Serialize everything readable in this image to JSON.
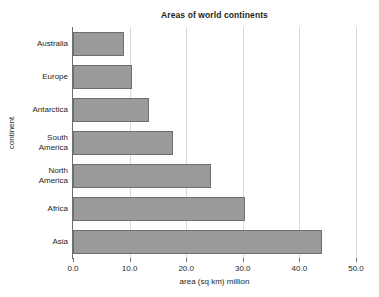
{
  "chart_data": {
    "type": "bar",
    "orientation": "horizontal",
    "title": "Areas of world continents",
    "xlabel": "area (sq km) million",
    "ylabel": "continent",
    "categories": [
      "Australia",
      "Europe",
      "Antarctica",
      "South\nAmerica",
      "North\nAmerica",
      "Africa",
      "Asia"
    ],
    "values": [
      9.0,
      10.4,
      13.4,
      17.7,
      24.4,
      30.4,
      44.0
    ],
    "xlim": [
      0.0,
      50.0
    ],
    "xticks": [
      0.0,
      10.0,
      20.0,
      30.0,
      40.0,
      50.0
    ],
    "xtick_labels": [
      "0.0",
      "10.0",
      "20.0",
      "30.0",
      "40.0",
      "50.0"
    ],
    "grid": "vertical-major",
    "legend": null,
    "bar_color": "#9a9a9a",
    "bar_border_color": "#6f6f6f",
    "gridline_color": "#d9d9d9",
    "axis_color": "#6d6e71",
    "background_color": "#ffffff"
  }
}
